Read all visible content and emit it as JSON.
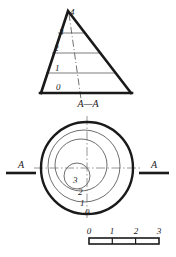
{
  "drawing": {
    "title_section": "A—A",
    "section_marker_left": "A",
    "section_marker_right": "A"
  },
  "elevation_view": {
    "name": "conical-hill-section",
    "contour_labels": [
      "4",
      "3",
      "2",
      "1",
      "0"
    ],
    "apex_label": "4",
    "levels": [
      {
        "label": "4",
        "x": 70,
        "y": 12
      },
      {
        "label": "3",
        "x": 61,
        "y": 32
      },
      {
        "label": "2",
        "x": 56,
        "y": 52
      },
      {
        "label": "1",
        "x": 57,
        "y": 72
      },
      {
        "label": "0",
        "x": 58,
        "y": 90
      }
    ]
  },
  "plan_view": {
    "name": "concentric-contour-circles",
    "contour_labels": [
      {
        "label": "3",
        "x": 73,
        "y": 180
      },
      {
        "label": "2",
        "x": 78,
        "y": 192
      },
      {
        "label": "1",
        "x": 80,
        "y": 203
      },
      {
        "label": "0",
        "x": 85,
        "y": 212
      }
    ]
  },
  "scale_bar": {
    "name": "graphic-scale",
    "ticks": [
      "0",
      "1",
      "2",
      "3"
    ],
    "tick_x": [
      89,
      112,
      136,
      159
    ]
  },
  "colors": {
    "ink": "#1a1a1a",
    "thin": "#6e6e6e",
    "centerline": "#8a8a8a"
  }
}
